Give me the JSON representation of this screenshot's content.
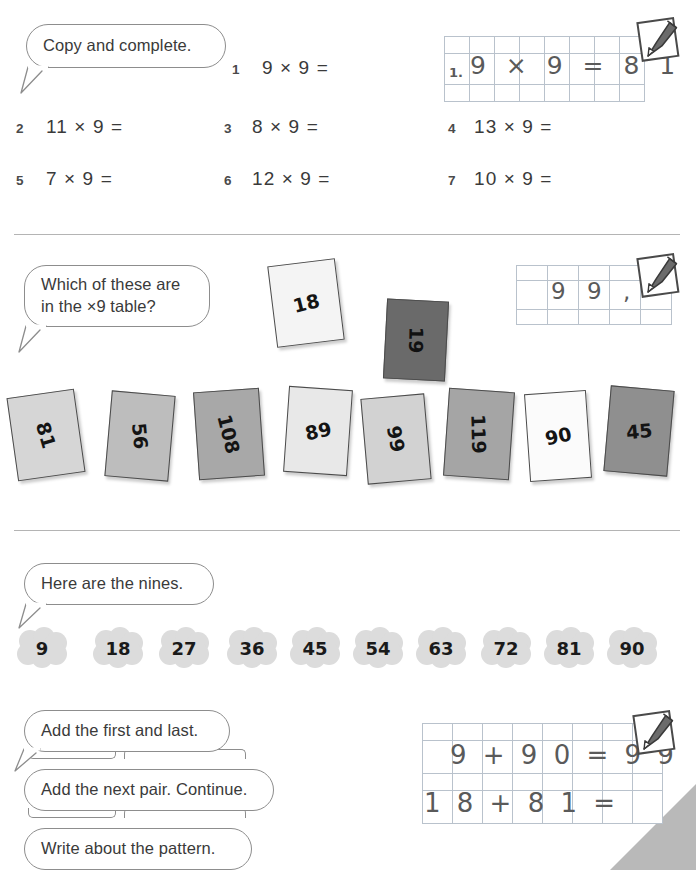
{
  "sections": {
    "one": {
      "prompt": "Copy and complete.",
      "questions": [
        {
          "num": "1",
          "text": "9 × 9 ="
        },
        {
          "num": "2",
          "text": "11 × 9 ="
        },
        {
          "num": "3",
          "text": "8 × 9 ="
        },
        {
          "num": "4",
          "text": "13 × 9 ="
        },
        {
          "num": "5",
          "text": "7 × 9 ="
        },
        {
          "num": "6",
          "text": "12 × 9 ="
        },
        {
          "num": "7",
          "text": "10 × 9 ="
        }
      ],
      "answer_grid": {
        "columns": 8,
        "rows": 3,
        "label": "1.",
        "handwriting": "9 × 9 = 8 1"
      }
    },
    "two": {
      "prompt_line1": "Which of these are",
      "prompt_line2": "in the ×9 table?",
      "cards": [
        {
          "value": "18",
          "shade": "#f4f4f4",
          "rotate": -7,
          "numrotate": -7
        },
        {
          "value": "19",
          "shade": "#6a6a6a",
          "rotate": 3,
          "numrotate": 88
        },
        {
          "value": "81",
          "shade": "#d6d6d6",
          "rotate": -8,
          "numrotate": 82
        },
        {
          "value": "56",
          "shade": "#bdbdbd",
          "rotate": 5,
          "numrotate": 80
        },
        {
          "value": "108",
          "shade": "#a8a8a8",
          "rotate": -4,
          "numrotate": 80
        },
        {
          "value": "89",
          "shade": "#e8e8e8",
          "rotate": 4,
          "numrotate": -16
        },
        {
          "value": "99",
          "shade": "#d2d2d2",
          "rotate": -5,
          "numrotate": 84
        },
        {
          "value": "119",
          "shade": "#a5a5a5",
          "rotate": 4,
          "numrotate": 84
        },
        {
          "value": "90",
          "shade": "#fbfbfb",
          "rotate": -4,
          "numrotate": -8
        },
        {
          "value": "45",
          "shade": "#8f8f8f",
          "rotate": 5,
          "numrotate": -10
        }
      ],
      "answer_grid": {
        "columns": 5,
        "rows": 3,
        "handwriting": "9 9 ,"
      }
    },
    "three": {
      "prompt": "Here are the nines.",
      "nines": [
        "9",
        "18",
        "27",
        "36",
        "45",
        "54",
        "63",
        "72",
        "81",
        "90"
      ]
    },
    "four": {
      "bubbles": [
        "Add the first and last.",
        "Add the next pair. Continue.",
        "Write about the pattern."
      ],
      "answer_grid": {
        "columns": 8,
        "rows": 4,
        "row1": "9 + 9 0 = 9 9",
        "row2": "1 8 + 8 1 ="
      }
    }
  },
  "icons": {
    "pencil_note": "pencil-note-icon"
  },
  "colors": {
    "rule": "#b4b4b4",
    "bubble_stroke": "#8d8d8d",
    "grid_line": "#b9c2cc",
    "handwriting": "#5a5a5a",
    "corner_fold": "#b9b9b9"
  }
}
